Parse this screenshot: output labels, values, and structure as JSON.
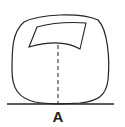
{
  "diagram": {
    "label": "A",
    "stroke_color": "#222222",
    "background": "#ffffff",
    "elements": [
      {
        "type": "rounded-outline",
        "description": "outer rounded contour"
      },
      {
        "type": "inner-shape",
        "description": "curved quadrilateral near top"
      },
      {
        "type": "dashed-line",
        "description": "vertical dashed line from inner shape to baseline"
      },
      {
        "type": "baseline",
        "description": "horizontal ground line"
      }
    ]
  }
}
